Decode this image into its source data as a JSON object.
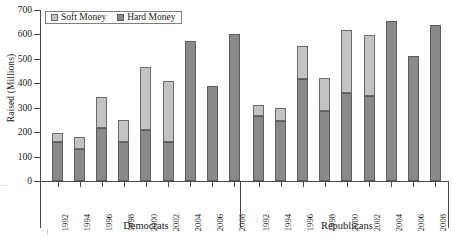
{
  "chart_data": {
    "type": "bar",
    "subtype": "stacked-bar-grouped",
    "title": "",
    "xlabel": "",
    "ylabel": "Raised (Millions)",
    "ylim": [
      0,
      700
    ],
    "yticks": [
      0,
      100,
      200,
      300,
      400,
      500,
      600,
      700
    ],
    "grid": false,
    "legend_position": "top-left",
    "legend": [
      "Soft Money",
      "Hard Money"
    ],
    "groups": [
      {
        "label": "Democrats",
        "categories": [
          "1992",
          "1994",
          "1996",
          "1998",
          "2000",
          "2002",
          "2004",
          "2006",
          "2008"
        ],
        "series": [
          {
            "name": "Hard Money",
            "values": [
              160,
              130,
              218,
              158,
              209,
              160,
              574,
              390,
              600
            ]
          },
          {
            "name": "Soft Money",
            "values": [
              37,
              50,
              126,
              93,
              258,
              250,
              0,
              0,
              0
            ]
          }
        ],
        "totals": [
          197,
          180,
          344,
          251,
          467,
          410,
          574,
          390,
          600
        ]
      },
      {
        "label": "Republicans",
        "categories": [
          "1992",
          "1994",
          "1996",
          "1998",
          "2000",
          "2002",
          "2004",
          "2006",
          "2008"
        ],
        "series": [
          {
            "name": "Hard Money",
            "values": [
              266,
              246,
              418,
              287,
              361,
              349,
              656,
              512,
              640
            ]
          },
          {
            "name": "Soft Money",
            "values": [
              45,
              52,
              135,
              135,
              258,
              250,
              0,
              0,
              0
            ]
          }
        ],
        "totals": [
          311,
          298,
          553,
          422,
          619,
          599,
          656,
          512,
          640
        ]
      }
    ]
  },
  "axis": {
    "ytick_labels": [
      "700",
      "600",
      "500",
      "400",
      "300",
      "200",
      "100",
      "0"
    ],
    "ylabel": "Raised (Millions)"
  },
  "legend": {
    "items": [
      {
        "label": "Soft Money",
        "swatch": "soft-money-swatch",
        "color": "#c3c3c3"
      },
      {
        "label": "Hard Money",
        "swatch": "hard-money-swatch",
        "color": "#8a8a8a"
      }
    ]
  },
  "colors": {
    "soft_money": "#c3c3c3",
    "hard_money": "#8a8a8a",
    "axis": "#4a4a4a",
    "background": "#ffffff"
  }
}
